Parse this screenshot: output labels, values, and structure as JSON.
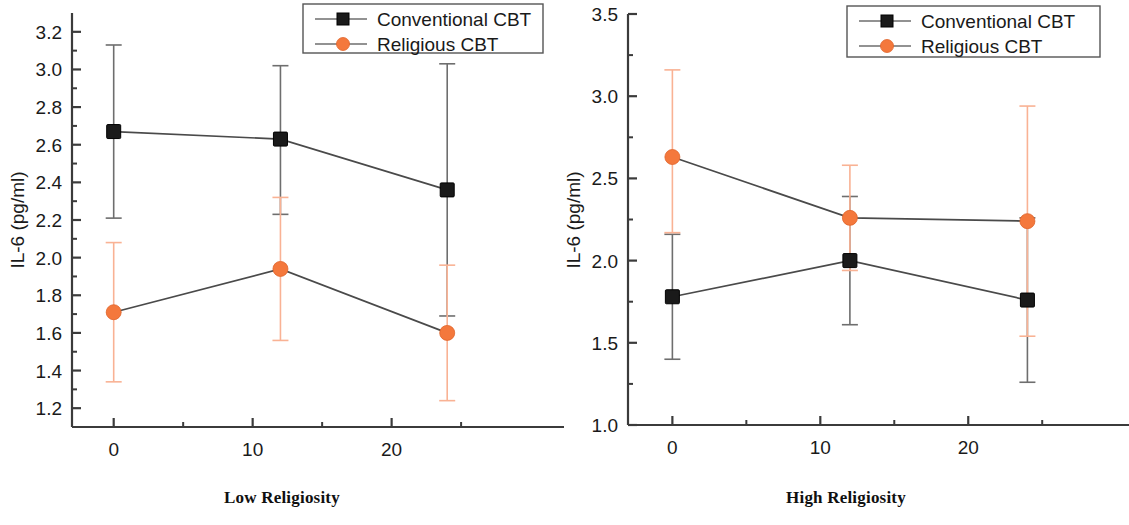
{
  "figure": {
    "panels": [
      {
        "id": "low-religiosity",
        "caption": "Low Religiosity",
        "xlabel": "Week",
        "ylabel": "IL-6 (pg/ml)"
      },
      {
        "id": "high-religiosity",
        "caption": "High Religiosity",
        "xlabel": "Week",
        "ylabel": "IL-6 (pg/ml)"
      }
    ]
  },
  "colors": {
    "conventional": "#1a1a1a",
    "religious": "#f4783c",
    "religious_error": "#f9b294",
    "axis": "#3b3b3b",
    "line": "#4a4a4a"
  },
  "legend": {
    "entries": [
      {
        "label": "Conventional CBT",
        "marker": "square",
        "color": "#1a1a1a"
      },
      {
        "label": "Religious CBT",
        "marker": "circle",
        "color": "#f4783c"
      }
    ]
  },
  "chart_data": [
    {
      "type": "line",
      "title": "Low Religiosity",
      "xlabel": "Week",
      "ylabel": "IL-6 (pg/ml)",
      "xlim": [
        -3,
        26
      ],
      "ylim": [
        1.1,
        3.3
      ],
      "xticks": [
        0,
        10,
        20
      ],
      "xtick_labels": [
        "0",
        "10",
        "20"
      ],
      "xminor_ticks": [
        5,
        15,
        25
      ],
      "yticks": [
        1.2,
        1.4,
        1.6,
        1.8,
        2.0,
        2.2,
        2.4,
        2.6,
        2.8,
        3.0,
        3.2
      ],
      "ytick_labels": [
        "1.2",
        "1.4",
        "1.6",
        "1.8",
        "2.0",
        "2.2",
        "2.4",
        "2.6",
        "2.8",
        "3.0",
        "3.2"
      ],
      "grid": false,
      "legend_position": "top-right",
      "x": [
        0,
        12,
        24
      ],
      "series": [
        {
          "name": "Conventional CBT",
          "marker": "square",
          "color": "#1a1a1a",
          "values": [
            2.67,
            2.63,
            2.36
          ],
          "err_low": [
            0.46,
            0.4,
            0.67
          ],
          "err_high": [
            0.46,
            0.39,
            0.67
          ]
        },
        {
          "name": "Religious CBT",
          "marker": "circle",
          "color": "#f4783c",
          "values": [
            1.71,
            1.94,
            1.6
          ],
          "err_low": [
            0.37,
            0.38,
            0.36
          ],
          "err_high": [
            0.37,
            0.38,
            0.36
          ]
        }
      ]
    },
    {
      "type": "line",
      "title": "High Religiosity",
      "xlabel": "Week",
      "ylabel": "IL-6 (pg/ml)",
      "xlim": [
        -3,
        26
      ],
      "ylim": [
        1.0,
        3.5
      ],
      "xticks": [
        0,
        10,
        20
      ],
      "xtick_labels": [
        "0",
        "10",
        "20"
      ],
      "xminor_ticks": [
        5,
        15,
        25
      ],
      "yticks": [
        1.0,
        1.5,
        2.0,
        2.5,
        3.0,
        3.5
      ],
      "ytick_labels": [
        "1.0",
        "1.5",
        "2.0",
        "2.5",
        "3.0",
        "3.5"
      ],
      "yminor_ticks": [
        1.25,
        1.75,
        2.25,
        2.75,
        3.25
      ],
      "grid": false,
      "legend_position": "top-right",
      "x": [
        0,
        12,
        24
      ],
      "series": [
        {
          "name": "Conventional CBT",
          "marker": "square",
          "color": "#1a1a1a",
          "values": [
            1.78,
            2.0,
            1.76
          ],
          "err_low": [
            0.38,
            0.39,
            0.5
          ],
          "err_high": [
            0.38,
            0.39,
            0.5
          ]
        },
        {
          "name": "Religious CBT",
          "marker": "circle",
          "color": "#f4783c",
          "values": [
            2.63,
            2.26,
            2.24
          ],
          "err_low": [
            0.46,
            0.32,
            0.7
          ],
          "err_high": [
            0.53,
            0.32,
            0.7
          ]
        }
      ]
    }
  ]
}
